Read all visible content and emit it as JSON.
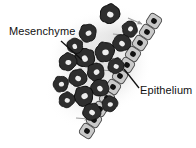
{
  "figure": {
    "background_color": "#ffffff"
  },
  "labels": {
    "mesenchyme": "Mesenchyme",
    "epithelium": "Epithelium",
    "text_color": "#111111"
  },
  "colors": {
    "mesenchyme_cell_body": "#2e2e2e",
    "mesenchyme_cell_outline": "#0d0d0d",
    "mesenchyme_nucleus": "#eeeeee",
    "epithelium_cell_body": "#c9c9c9",
    "epithelium_cell_outline": "#4a4a4a",
    "epithelium_nucleus": "#121212",
    "arrow": "#9a9a9a",
    "halo": "#e2e2e2",
    "leader_line": "#111111"
  },
  "structures": {
    "mesenchyme": {
      "name": "Mesenchyme",
      "description": "Loose cluster of dark, irregular star-shaped mesenchymal cells with pale nuclei surrounded by a soft gray halo",
      "cell_count": 17,
      "cells": [
        {
          "cx": 110,
          "cy": 14,
          "r": 10,
          "rot": 18
        },
        {
          "cx": 88,
          "cy": 33,
          "r": 9,
          "rot": -25
        },
        {
          "cx": 122,
          "cy": 43,
          "r": 9,
          "rot": 40
        },
        {
          "cx": 105,
          "cy": 52,
          "r": 10,
          "rot": -10
        },
        {
          "cx": 85,
          "cy": 58,
          "r": 10,
          "rot": 60
        },
        {
          "cx": 68,
          "cy": 62,
          "r": 9,
          "rot": 8
        },
        {
          "cx": 96,
          "cy": 72,
          "r": 9,
          "rot": -40
        },
        {
          "cx": 116,
          "cy": 66,
          "r": 8,
          "rot": 25
        },
        {
          "cx": 78,
          "cy": 78,
          "r": 9,
          "rot": 30
        },
        {
          "cx": 61,
          "cy": 84,
          "r": 8,
          "rot": -18
        },
        {
          "cx": 100,
          "cy": 88,
          "r": 9,
          "rot": 52
        },
        {
          "cx": 84,
          "cy": 96,
          "r": 10,
          "rot": -30
        },
        {
          "cx": 67,
          "cy": 100,
          "r": 8,
          "rot": 14
        },
        {
          "cx": 92,
          "cy": 112,
          "r": 9,
          "rot": 36
        },
        {
          "cx": 75,
          "cy": 46,
          "r": 8,
          "rot": 70
        },
        {
          "cx": 130,
          "cy": 29,
          "r": 8,
          "rot": -55
        },
        {
          "cx": 110,
          "cy": 104,
          "r": 8,
          "rot": 5
        }
      ]
    },
    "epithelium": {
      "name": "Epithelium",
      "description": "Single diagonal column of pale cuboidal epithelial cells each containing one dark nucleus",
      "cell_count": 11,
      "column_angle_deg": -58,
      "cells": [
        {
          "cx": 154,
          "cy": 21
        },
        {
          "cx": 147,
          "cy": 32
        },
        {
          "cx": 140,
          "cy": 43
        },
        {
          "cx": 133,
          "cy": 54
        },
        {
          "cx": 127,
          "cy": 65
        },
        {
          "cx": 120,
          "cy": 76
        },
        {
          "cx": 113,
          "cy": 87
        },
        {
          "cx": 107,
          "cy": 98
        },
        {
          "cx": 100,
          "cy": 109
        },
        {
          "cx": 94,
          "cy": 120
        },
        {
          "cx": 87,
          "cy": 131
        }
      ]
    },
    "signaling_arrows": {
      "name": "Signaling arrows",
      "description": "Gray arrows pointing from the mesenchyme toward the epithelium",
      "count": 9,
      "direction": "mesenchyme-to-epithelium",
      "arrows": [
        {
          "x1": 128,
          "y1": 18,
          "x2": 142,
          "y2": 24
        },
        {
          "x1": 113,
          "y1": 34,
          "x2": 133,
          "y2": 36
        },
        {
          "x1": 112,
          "y1": 45,
          "x2": 128,
          "y2": 47
        },
        {
          "x1": 104,
          "y1": 58,
          "x2": 121,
          "y2": 59
        },
        {
          "x1": 100,
          "y1": 70,
          "x2": 115,
          "y2": 71
        },
        {
          "x1": 94,
          "y1": 82,
          "x2": 109,
          "y2": 83
        },
        {
          "x1": 88,
          "y1": 94,
          "x2": 103,
          "y2": 95
        },
        {
          "x1": 82,
          "y1": 106,
          "x2": 96,
          "y2": 107
        },
        {
          "x1": 76,
          "y1": 118,
          "x2": 89,
          "y2": 119
        }
      ]
    }
  },
  "leader_lines": {
    "mesenchyme": {
      "x1": 61,
      "y1": 41,
      "x2": 82,
      "y2": 60
    },
    "epithelium": {
      "x1": 139,
      "y1": 88,
      "x2": 124,
      "y2": 69
    }
  }
}
